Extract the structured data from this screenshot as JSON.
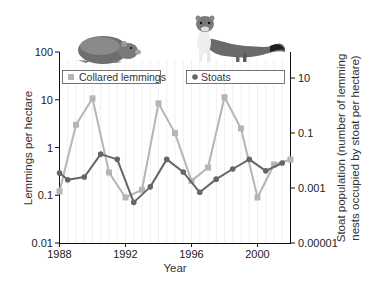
{
  "chart_data": {
    "type": "line",
    "title": "",
    "xlabel": "Year",
    "ylabel": "Lemmings per hectare",
    "ylabel_right": "Stoat population (number of lemming nests occupied by stoat per hectare)",
    "ylabel_right_lines": [
      "Stoat population (number of lemming",
      "nests occupied by stoat per hectare)"
    ],
    "x_ticks": [
      "1988",
      "1992",
      "1996",
      "2000"
    ],
    "xlim": [
      1988,
      2002
    ],
    "y_scale": "log",
    "ylim": [
      0.01,
      100
    ],
    "y_ticks": [
      "100",
      "10",
      "1",
      "0.1",
      "0.01"
    ],
    "y_right_scale": "log",
    "ylim_right": [
      1e-05,
      30
    ],
    "y_right_ticks": [
      "10",
      "0.1",
      "0.001",
      "0.00001"
    ],
    "grid": "vertical, every half year",
    "legend": [
      {
        "label": "Collared lemmings",
        "marker": "square",
        "color": "#b5b5b5"
      },
      {
        "label": "Stoats",
        "marker": "circle",
        "color": "#666666"
      }
    ],
    "series": [
      {
        "name": "Collared lemmings",
        "axis": "left",
        "x": [
          1988,
          1989,
          1990,
          1991,
          1992,
          1993,
          1994,
          1995,
          1996,
          1997,
          1998,
          1999,
          2000,
          2001,
          2002
        ],
        "values": [
          0.12,
          3,
          10.7,
          0.3,
          0.09,
          0.13,
          8.4,
          2,
          0.2,
          0.38,
          11.3,
          2.5,
          0.09,
          0.44,
          0.56
        ]
      },
      {
        "name": "Stoats",
        "axis": "right",
        "x": [
          1988,
          1988.5,
          1989.5,
          1990.5,
          1991.5,
          1992.5,
          1993.5,
          1994.5,
          1995.5,
          1996.5,
          1997.5,
          1998.5,
          1999.5,
          2000.5,
          2001.5
        ],
        "values": [
          0.0035,
          0.002,
          0.0025,
          0.017,
          0.011,
          0.0003,
          0.0011,
          0.011,
          0.0038,
          0.0007,
          0.0021,
          0.0049,
          0.011,
          0.0042,
          0.0081
        ]
      }
    ],
    "illustrations": [
      "collared-lemming",
      "stoat"
    ]
  }
}
